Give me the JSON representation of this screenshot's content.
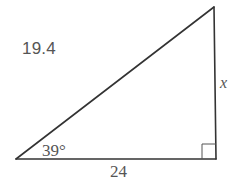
{
  "problem": {
    "number": "19.4"
  },
  "triangle": {
    "type": "right-triangle",
    "angle_label": "39°",
    "adjacent_side_label": "24",
    "opposite_side_label": "x",
    "right_angle_marker": true,
    "vertices": {
      "angle_vertex": [
        16,
        159
      ],
      "right_angle_vertex": [
        216,
        159
      ],
      "top_vertex": [
        214,
        7
      ]
    },
    "stroke_color": "#333333",
    "label_color": "#555555"
  }
}
